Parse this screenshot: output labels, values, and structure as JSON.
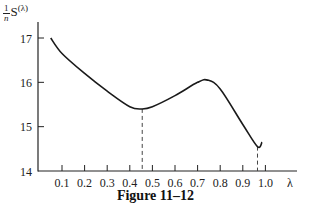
{
  "chart_data": {
    "type": "line",
    "title": "",
    "caption": "Figure 11–12",
    "xlabel": "λ",
    "ylabel": "1/n S(λ)",
    "ylabel_parts": {
      "frac_num": "1",
      "frac_den": "n",
      "main": "S",
      "sup": "(λ)"
    },
    "xlim": [
      0.0,
      1.12
    ],
    "ylim": [
      14,
      17
    ],
    "x_ticks": [
      "0.1",
      "0.2",
      "0.3",
      "0.4",
      "0.5",
      "0.6",
      "0.7",
      "0.8",
      "0.9",
      "1.0"
    ],
    "y_ticks": [
      "14",
      "15",
      "16",
      "17"
    ],
    "grid": false,
    "legend": null,
    "series": [
      {
        "name": "S(λ)/n",
        "x": [
          0.05,
          0.1,
          0.2,
          0.3,
          0.4,
          0.455,
          0.5,
          0.6,
          0.7,
          0.745,
          0.8,
          0.9,
          0.965,
          0.985
        ],
        "y": [
          17.0,
          16.65,
          16.2,
          15.8,
          15.45,
          15.4,
          15.45,
          15.7,
          16.0,
          16.05,
          15.85,
          15.05,
          14.55,
          14.65
        ]
      }
    ],
    "annotations": [
      {
        "type": "vertical-dashed-line",
        "x": 0.455,
        "label": "local minimum"
      },
      {
        "type": "vertical-dashed-line",
        "x": 0.965,
        "label": "global minimum"
      }
    ]
  }
}
